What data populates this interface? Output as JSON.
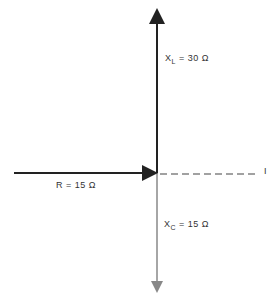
{
  "diagram": {
    "title": "",
    "type": "phasor-diagram",
    "vectors": [
      {
        "name": "XL",
        "label_main": "X",
        "label_sub": "L",
        "label_rest": " = 30 Ω",
        "direction": "up",
        "value": 30,
        "unit": "Ω"
      },
      {
        "name": "R",
        "label": "R = 15 Ω",
        "direction": "right",
        "value": 15,
        "unit": "Ω"
      },
      {
        "name": "XC",
        "label_main": "X",
        "label_sub": "C",
        "label_rest": " = 15 Ω",
        "direction": "down",
        "value": 15,
        "unit": "Ω"
      }
    ],
    "reference": {
      "label": "I",
      "style": "dashed"
    },
    "colors": {
      "xl": "#222222",
      "r": "#222222",
      "xc": "#888888",
      "ref": "#444444"
    }
  }
}
